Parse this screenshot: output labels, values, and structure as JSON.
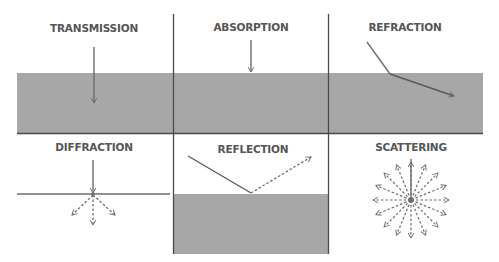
{
  "diagram": {
    "colors": {
      "medium": "#a7a7a7",
      "line": "#5a5a5a",
      "arrow": "#6e6e6e",
      "label": "#555555",
      "background": "#ffffff"
    },
    "panels": [
      {
        "id": "transmission",
        "label": "TRANSMISSION"
      },
      {
        "id": "absorption",
        "label": "ABSORPTION"
      },
      {
        "id": "refraction",
        "label": "REFRACTION"
      },
      {
        "id": "diffraction",
        "label": "DIFFRACTION"
      },
      {
        "id": "reflection",
        "label": "REFLECTION"
      },
      {
        "id": "scattering",
        "label": "SCATTERING",
        "ray_count": 16
      }
    ]
  }
}
